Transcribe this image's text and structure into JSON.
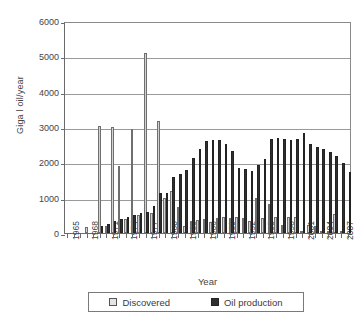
{
  "chart_data": {
    "type": "bar",
    "title": "",
    "xlabel": "Year",
    "ylabel": "Giga l oil/year",
    "ylim": [
      0,
      6000
    ],
    "yticks": [
      0,
      1000,
      2000,
      3000,
      4000,
      5000,
      6000
    ],
    "ytick_labels": [
      "0",
      "1000",
      "2000",
      "3000",
      "4000",
      "5000",
      "6000"
    ],
    "grid": true,
    "legend_position": "below",
    "legend": [
      "Discovered",
      "Oil production"
    ],
    "xtick_labels": [
      "1965",
      "1968",
      "1971",
      "1974",
      "1977",
      "1980",
      "1983",
      "1986",
      "1989",
      "1992",
      "1995",
      "1998",
      "2001",
      "2004",
      "2007"
    ],
    "xtick_interval": 3,
    "categories": [
      "1965",
      "1966",
      "1967",
      "1968",
      "1969",
      "1970",
      "1971",
      "1972",
      "1973",
      "1974",
      "1975",
      "1976",
      "1977",
      "1978",
      "1979",
      "1980",
      "1981",
      "1982",
      "1983",
      "1984",
      "1985",
      "1986",
      "1987",
      "1988",
      "1989",
      "1990",
      "1991",
      "1992",
      "1993",
      "1994",
      "1995",
      "1996",
      "1997",
      "1998",
      "1999",
      "2000",
      "2001",
      "2002",
      "2003",
      "2004",
      "2005",
      "2006",
      "2007",
      "2008"
    ],
    "series": [
      {
        "name": "Discovered",
        "color": "#d2d2d2",
        "values": [
          0,
          0,
          0,
          180,
          0,
          3040,
          200,
          2990,
          1890,
          400,
          2940,
          520,
          5100,
          580,
          3170,
          980,
          1180,
          730,
          200,
          330,
          370,
          400,
          300,
          430,
          440,
          430,
          440,
          420,
          350,
          1000,
          430,
          830,
          440,
          230,
          440,
          440,
          30,
          230,
          190,
          40,
          40,
          530,
          60,
          0
        ]
      },
      {
        "name": "Oil production",
        "color": "#2f2f2f",
        "values": [
          0,
          0,
          0,
          0,
          0,
          200,
          260,
          330,
          400,
          460,
          520,
          560,
          600,
          760,
          1120,
          1140,
          1580,
          1680,
          1780,
          2130,
          2370,
          2600,
          2640,
          2640,
          2510,
          2310,
          1850,
          1820,
          1750,
          1920,
          2100,
          2650,
          2680,
          2660,
          2640,
          2670,
          2830,
          2520,
          2430,
          2370,
          2290,
          2180,
          1980,
          1730
        ]
      }
    ],
    "notes": {
      "discovery_peak_year": "1974",
      "discovery_peak_value": 5100,
      "production_peak_year": "2001",
      "production_peak_value": 2830
    }
  }
}
